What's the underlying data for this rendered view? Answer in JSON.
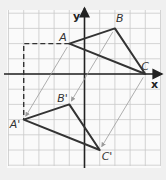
{
  "figure": {
    "background": "#f0f0f0",
    "panel_color": "#fafafa",
    "grid_color": "#c9c9c9",
    "line_color": "#333333",
    "arrow_color": "#9a9a9a",
    "axes": {
      "x_label": "x",
      "y_label": "y"
    },
    "grid": {
      "x_min": -5,
      "x_max": 5,
      "y_min": -6,
      "y_max": 4,
      "unit_px": 15.2,
      "origin_px": [
        84.5,
        74
      ]
    },
    "triangle_original": {
      "vertices": [
        {
          "name": "A",
          "x": -1,
          "y": 2
        },
        {
          "name": "B",
          "x": 2,
          "y": 3
        },
        {
          "name": "C",
          "x": 4,
          "y": 0
        }
      ]
    },
    "triangle_image": {
      "vertices": [
        {
          "name": "A'",
          "x": -4,
          "y": -3
        },
        {
          "name": "B'",
          "x": -1,
          "y": -2
        },
        {
          "name": "C'",
          "x": 1,
          "y": -5
        }
      ]
    },
    "translation_vector": {
      "dx": -3,
      "dy": -5
    },
    "dashed_path": [
      {
        "x": -1,
        "y": 2
      },
      {
        "x": -4,
        "y": 2
      },
      {
        "x": -4,
        "y": -3
      }
    ],
    "labels": {
      "A": "A",
      "B": "B",
      "C": "C",
      "A_prime": "A'",
      "B_prime": "B'",
      "C_prime": "C'"
    }
  }
}
